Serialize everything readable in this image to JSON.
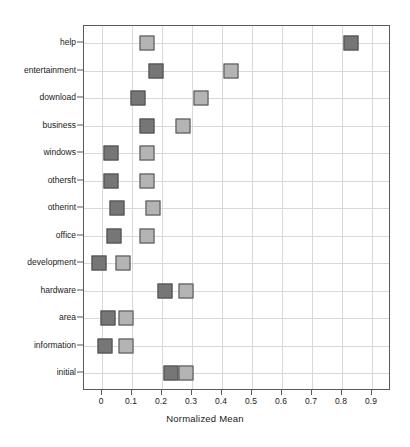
{
  "chart_data": {
    "type": "scatter",
    "title": "",
    "xlabel": "Normalized Mean",
    "ylabel": "",
    "xlim": [
      -0.06,
      0.96
    ],
    "xticks": [
      "0",
      "0.1",
      "0.2",
      "0.3",
      "0.4",
      "0.5",
      "0.6",
      "0.7",
      "0.8",
      "0.9"
    ],
    "xtick_values": [
      0,
      0.1,
      0.2,
      0.3,
      0.4,
      0.5,
      0.6,
      0.7,
      0.8,
      0.9
    ],
    "categories": [
      "help",
      "entertainment",
      "download",
      "business",
      "windows",
      "othersft",
      "otherint",
      "office",
      "development",
      "hardware",
      "area",
      "information",
      "initial"
    ],
    "grid": true,
    "legend": "none",
    "marker": "square",
    "series": [
      {
        "name": "dark",
        "color": "#767676",
        "values": [
          0.83,
          0.18,
          0.12,
          0.15,
          0.03,
          0.03,
          0.05,
          0.04,
          -0.01,
          0.21,
          0.02,
          0.01,
          0.23
        ]
      },
      {
        "name": "light",
        "color": "#b4b4b4",
        "values": [
          0.15,
          0.43,
          0.33,
          0.27,
          0.15,
          0.15,
          0.17,
          0.15,
          0.07,
          0.28,
          0.08,
          0.08,
          0.28
        ]
      }
    ]
  }
}
